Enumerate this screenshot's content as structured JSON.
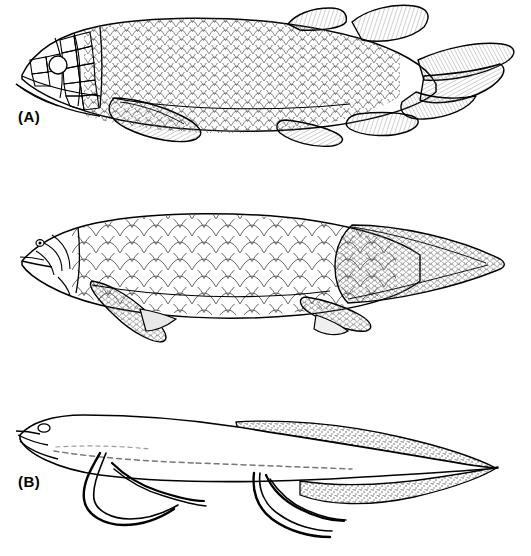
{
  "figure": {
    "type": "scientific-illustration",
    "width": 531,
    "height": 556,
    "background_color": "#ffffff",
    "ink_color": "#000000",
    "shading_color": "#888888",
    "panels": [
      {
        "id": "A",
        "label": "(A)",
        "description": "Heavily armoured fish with plated bony head, dense small rhombic scales, lobed pectoral and pelvic fins, two dorsal fins and a three-lobed (triphycercal) tail",
        "head_style": "plated",
        "scale_style": "small-rhombic",
        "tail_style": "three-lobed",
        "paired_fins": "lobed-scaled",
        "dorsal_fins": 2
      },
      {
        "id": "B",
        "label": "(B)",
        "description": "Elongate fish with large rounded cycloid scales, pointed snout, scaled lobed pectoral and pelvic fins and a pointed symmetrical diphycercal tail",
        "head_style": "smooth-with-sensory-canals",
        "scale_style": "large-cycloid",
        "tail_style": "pointed-diphycercal",
        "paired_fins": "lobed-scaled",
        "dorsal_fins": 0
      },
      {
        "id": "C",
        "label": "(C)",
        "description": "Eel-like fish with naked smooth body, oval eye, filamentous thread-like paired appendages and a continuous stippled dorsal and ventral fin fold tapering to a fine point",
        "head_style": "smooth-naked",
        "scale_style": "none",
        "tail_style": "tapering-fin-fold",
        "paired_fins": "filamentous",
        "dorsal_fins": 0
      }
    ]
  }
}
